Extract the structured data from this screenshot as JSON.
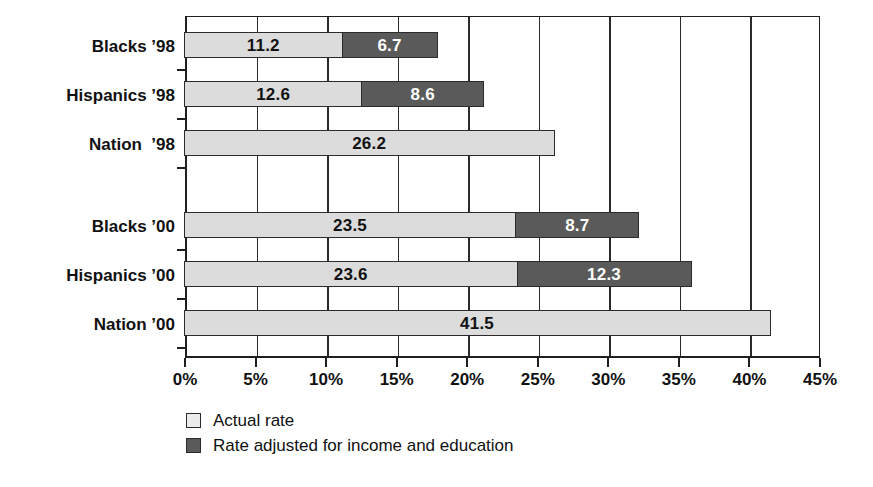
{
  "chart_data": {
    "type": "bar",
    "orientation": "horizontal",
    "stacked": true,
    "title": "",
    "xlabel": "",
    "ylabel": "",
    "xlim": [
      0,
      45
    ],
    "xunit": "%",
    "grid": true,
    "legend_position": "bottom-left",
    "tick_labels": [
      "0%",
      "5%",
      "10%",
      "15%",
      "20%",
      "25%",
      "30%",
      "35%",
      "40%",
      "45%"
    ],
    "tick_values": [
      0,
      5,
      10,
      15,
      20,
      25,
      30,
      35,
      40,
      45
    ],
    "series": [
      {
        "name": "Actual rate",
        "key": "actual",
        "color": "#dcdcdc"
      },
      {
        "name": "Rate adjusted for income and education",
        "key": "adjusted",
        "color": "#5a5a5a"
      }
    ],
    "groups": [
      {
        "name": "group-1998",
        "rows": [
          {
            "category": "Blacks ’98",
            "actual": 11.2,
            "actual_label": "11.2",
            "adjusted": 6.7,
            "adjusted_label": "6.7"
          },
          {
            "category": "Hispanics ’98",
            "actual": 12.6,
            "actual_label": "12.6",
            "adjusted": 8.6,
            "adjusted_label": "8.6"
          },
          {
            "category": "Nation  ’98",
            "actual": 26.2,
            "actual_label": "26.2",
            "adjusted": null,
            "adjusted_label": ""
          }
        ]
      },
      {
        "name": "group-2000",
        "rows": [
          {
            "category": "Blacks ’00",
            "actual": 23.5,
            "actual_label": "23.5",
            "adjusted": 8.7,
            "adjusted_label": "8.7"
          },
          {
            "category": "Hispanics ’00",
            "actual": 23.6,
            "actual_label": "23.6",
            "adjusted": 12.3,
            "adjusted_label": "12.3"
          },
          {
            "category": "Nation ’00",
            "actual": 41.5,
            "actual_label": "41.5",
            "adjusted": null,
            "adjusted_label": ""
          }
        ]
      }
    ]
  },
  "legend": {
    "items": [
      {
        "label": "Actual rate",
        "swatch": "light"
      },
      {
        "label": "Rate adjusted for income and education",
        "swatch": "dark"
      }
    ]
  },
  "axis": {
    "x_labels": [
      "0%",
      "5%",
      "10%",
      "15%",
      "20%",
      "25%",
      "30%",
      "35%",
      "40%",
      "45%"
    ],
    "y_labels": [
      "Blacks ’98",
      "Hispanics ’98",
      "Nation  ’98",
      "Blacks ’00",
      "Hispanics ’00",
      "Nation ’00"
    ]
  },
  "colors": {
    "actual": "#dcdcdc",
    "adjusted": "#5a5a5a",
    "axis": "#1f1f1f",
    "background": "#ffffff",
    "text": "#111111"
  }
}
